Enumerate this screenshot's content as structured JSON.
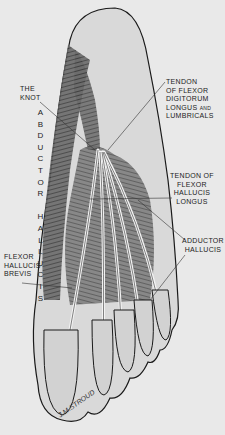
{
  "figure": {
    "labels": {
      "the_knot": [
        "THE",
        "KNOT"
      ],
      "abductor_hallucis_vertical": "ABDUCTOR HALLUCIS",
      "tendon_fdl": [
        "TENDON",
        "OF FLEXOR",
        "DIGITORUM",
        "LONGUS",
        "AND",
        "LUMBRICALS"
      ],
      "tendon_fhl": [
        "TENDON OF",
        "FLEXOR",
        "HALLUCIS",
        "LONGUS"
      ],
      "adductor_hallucis": [
        "ADDUCTOR",
        "HALLUCIS"
      ],
      "flexor_hallucis_brevis": [
        "FLEXOR",
        "HALLUCIS",
        "BREVIS"
      ]
    },
    "signature": "J.M.STROUD",
    "colors": {
      "background": "#e9e9e9",
      "skin": "#dcdcdc",
      "outline": "#1a1a1a",
      "muscle": "#555555",
      "tendon": "#f4f4f4"
    }
  }
}
